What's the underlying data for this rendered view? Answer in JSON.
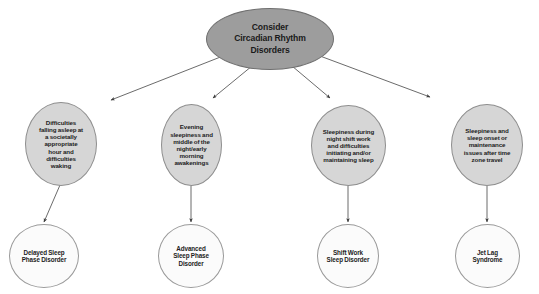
{
  "diagram": {
    "type": "flowchart",
    "title": "Consider Circadian Rhythm Disorders",
    "colors": {
      "root_fill": "#9d9d9d",
      "root_border": "#6f6f6f",
      "symptom_fill": "#d6d6d6",
      "symptom_border": "#8e8e8e",
      "diagnosis_fill": "#fbfbfb",
      "diagnosis_border": "#9a9a9a",
      "edge": "#5a5a5a",
      "text": "#1c1c1c",
      "background": "#ffffff"
    },
    "root": {
      "label": "Consider\nCircadian Rhythm\nDisorders",
      "shape": "ellipse"
    },
    "symptoms": [
      {
        "label": "Difficulties\nfalling asleep at\na societally\nappropriate\nhour and\ndifficulties\nwaking"
      },
      {
        "label": "Evening\nsleepiness and\nmiddle of the\nnight/early\nmorning\nawakenings"
      },
      {
        "label": "Sleepiness during\nnight shift work\nand difficulties\ninitiating and/or\nmaintaining sleep"
      },
      {
        "label": "Sleepiness and\nsleep onset or\nmaintenance\nissues after time\nzone travel"
      }
    ],
    "diagnoses": [
      {
        "label": "Delayed Sleep\nPhase Disorder"
      },
      {
        "label": "Advanced\nSleep Phase\nDisorder"
      },
      {
        "label": "Shift Work\nSleep Disorder"
      },
      {
        "label": "Jet Lag\nSyndrome"
      }
    ],
    "caption": ""
  }
}
